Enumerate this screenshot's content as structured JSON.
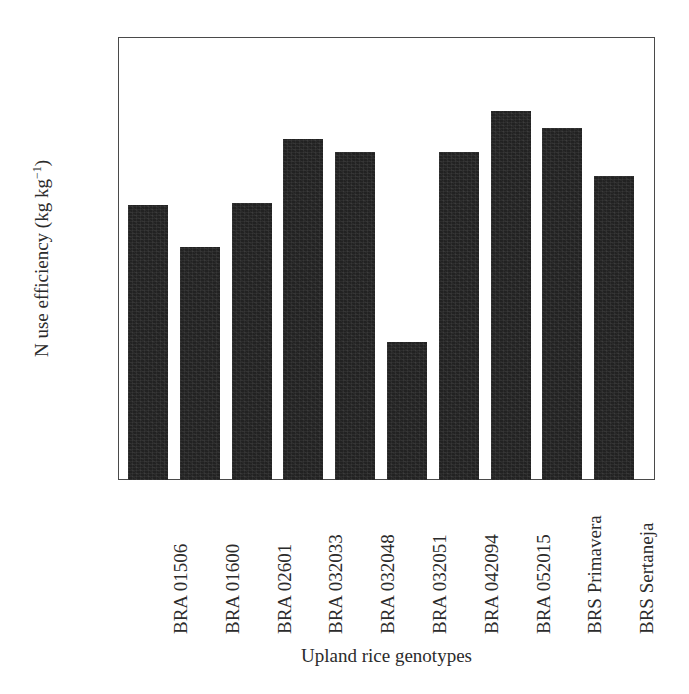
{
  "chart_data": {
    "type": "bar",
    "title": "",
    "xlabel": "Upland rice genotypes",
    "ylabel": "N use efficiency (kg kg−1)",
    "ylabel_base": "N use efficiency (kg kg",
    "ylabel_exponent": "−1",
    "ylabel_tail": ")",
    "categories": [
      "BRA 01506",
      "BRA 01600",
      "BRA 02601",
      "BRA 032033",
      "BRA 032048",
      "BRA 032051",
      "BRA 042094",
      "BRA 052015",
      "BRS Primavera",
      "BRS Sertaneja"
    ],
    "values": [
      20.2,
      17.1,
      20.3,
      25.0,
      24.1,
      10.1,
      24.1,
      27.1,
      25.8,
      22.3
    ],
    "ylim": [
      0,
      32.5
    ],
    "yticks": [
      0,
      5,
      10,
      15,
      20,
      25,
      30
    ],
    "ytick_labels": [
      "0",
      "5",
      "10",
      "15",
      "20",
      "25",
      "30"
    ],
    "grid": false,
    "legend": "none",
    "bar_color": "#222222",
    "frame_color": "#4a4a4a",
    "background_color": "#ffffff",
    "series": [
      {
        "name": "N use efficiency",
        "values": [
          20.2,
          17.1,
          20.3,
          25.0,
          24.1,
          10.1,
          24.1,
          27.1,
          25.8,
          22.3
        ]
      }
    ]
  }
}
